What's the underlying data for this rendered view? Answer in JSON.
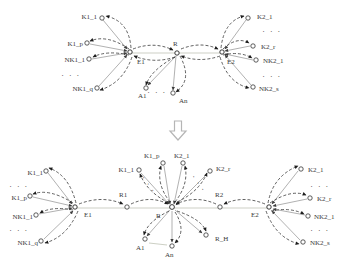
{
  "figure_type": "entity-merge-diagram",
  "ellipsis": "· · ·",
  "colors": {
    "background": "#ffffff",
    "dashed_edge": "#2b2b2b",
    "solid_edge": "#8f8f8f",
    "baseline": "#cdd0c5",
    "text": "#3a3a3a",
    "transform_arrow_outline": "#b5b5b5"
  },
  "top": {
    "labels": {
      "E1": "E1",
      "R": "R",
      "E2": "E2",
      "K1_1": "K1_1",
      "K1_p": "K1_p",
      "NK1_1": "NK1_1",
      "NK1_q": "NK1_q",
      "K2_1": "K2_1",
      "K2_r": "K2_r",
      "NK2_1": "NK2_1",
      "NK2_s": "NK2_s",
      "A1": "A1",
      "An": "An"
    }
  },
  "bottom": {
    "labels": {
      "E1": "E1",
      "R": "R",
      "E2": "E2",
      "R1": "R1",
      "R2": "R2",
      "R_H": "R_H",
      "K1_1": "K1_1",
      "K1_p": "K1_p",
      "NK1_1": "NK1_1",
      "NK1_q": "NK1_q",
      "K2_1": "K2_1",
      "K2_r": "K2_r",
      "NK2_1": "NK2_1",
      "NK2_s": "NK2_s",
      "A1": "A1",
      "An": "An",
      "center": {
        "K1_1": "K1_1",
        "K1_p": "K1_p",
        "K2_1": "K2_1",
        "K2_r": "K2_r"
      }
    }
  }
}
